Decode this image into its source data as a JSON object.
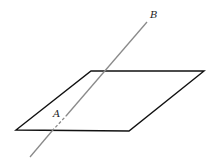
{
  "diagram": {
    "labels": {
      "A": "A",
      "B": "B"
    },
    "colors": {
      "plane_edge": "#111111",
      "line": "#8a8a8a"
    }
  }
}
